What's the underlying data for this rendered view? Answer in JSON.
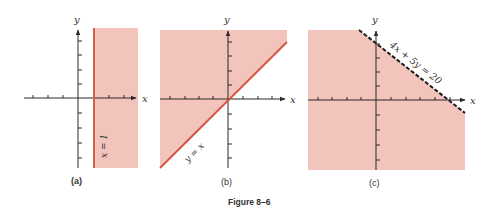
{
  "figure": {
    "caption": "Figure 8–6",
    "colors": {
      "shade": "#f2c4bc",
      "boundary_solid": "#d4533a",
      "boundary_dashed": "#1a1a1a",
      "axis": "#2a2a2a",
      "background": "#ffffff"
    },
    "panels": [
      {
        "id": "a",
        "label": "(a)",
        "x_axis_label": "x",
        "y_axis_label": "y",
        "boundary_label": "x = 1",
        "boundary_style": "solid",
        "region": "x ≥ 1"
      },
      {
        "id": "b",
        "label": "(b)",
        "x_axis_label": "x",
        "y_axis_label": "y",
        "boundary_label": "y = x",
        "boundary_style": "solid",
        "region": "y ≥ x"
      },
      {
        "id": "c",
        "label": "(c)",
        "x_axis_label": "x",
        "y_axis_label": "y",
        "boundary_label": "4x + 5y = 20",
        "boundary_style": "dashed",
        "region": "4x + 5y < 20"
      }
    ]
  }
}
